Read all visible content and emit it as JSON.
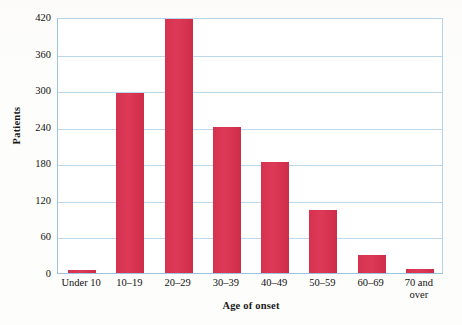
{
  "chart_data": {
    "type": "bar",
    "title": "",
    "xlabel": "Age of onset",
    "ylabel": "Patients",
    "categories": [
      "Under 10",
      "10–19",
      "20–29",
      "30–39",
      "40–49",
      "50–59",
      "60–69",
      "70 and\nover"
    ],
    "values": [
      5,
      295,
      417,
      240,
      182,
      103,
      30,
      6
    ],
    "ylim": [
      0,
      420
    ],
    "yticks": [
      0,
      60,
      120,
      180,
      240,
      300,
      360,
      420
    ],
    "ytick_labels": [
      "0",
      "60",
      "120",
      "180",
      "240",
      "300",
      "360",
      "420"
    ],
    "grid": "horizontal",
    "legend": "none",
    "bar_color": "#d6324f",
    "gridline_color": "#bcd9ec",
    "axis_color": "#9fc3dd",
    "background_color": "#ffffff"
  }
}
